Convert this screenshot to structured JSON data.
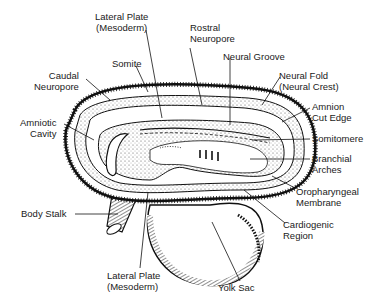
{
  "diagram": {
    "labels": {
      "lateral_plate_top": "Lateral Plate\n(Mesoderm)",
      "rostral_neuropore": "Rostral\nNeuropore",
      "somite": "Somite",
      "neural_groove": "Neural Groove",
      "caudal_neuropore": "Caudal\nNeuropore",
      "neural_fold": "Neural Fold\n(Neural Crest)",
      "amniotic_cavity": "Amniotic\nCavity",
      "amnion_cut_edge": "Amnion\nCut Edge",
      "somitomere": "Somitomere",
      "branchial_arches": "Branchial\nArches",
      "oropharyngeal_membrane": "Oropharyngeal\nMembrane",
      "body_stalk": "Body Stalk",
      "cardiogenic_region": "Cardiogenic\nRegion",
      "lateral_plate_bottom": "Lateral Plate\n(Mesoderm)",
      "yolk_sac": "Yolk Sac"
    },
    "colors": {
      "ink": "#1a1a1a",
      "background": "#ffffff",
      "stipple": "#bdbdbd"
    }
  }
}
